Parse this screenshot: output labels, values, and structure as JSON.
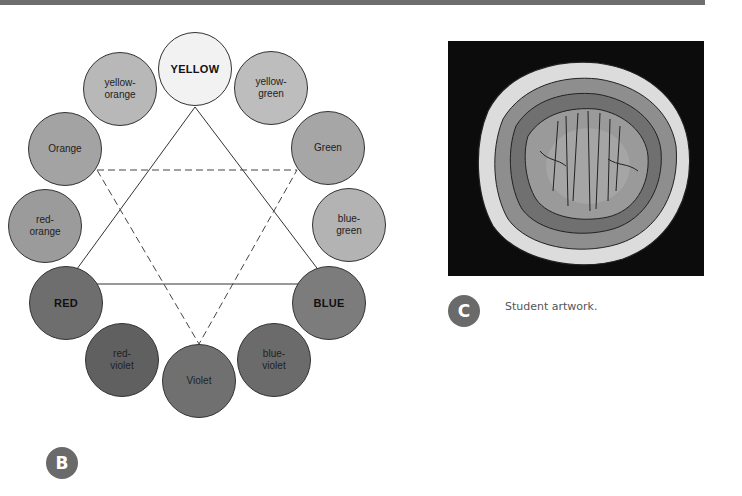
{
  "figure_b": {
    "badge": "B",
    "swatches": [
      {
        "id": "yellow",
        "label": "YELLOW",
        "primary": true,
        "cx": 195,
        "cy": 69,
        "fill": "#f2f2f2"
      },
      {
        "id": "yellow-green",
        "label": "yellow-\ngreen",
        "primary": false,
        "cx": 271,
        "cy": 88,
        "fill": "#bdbdbd"
      },
      {
        "id": "green",
        "label": "Green",
        "primary": false,
        "cx": 328,
        "cy": 148,
        "fill": "#a6a6a6"
      },
      {
        "id": "blue-green",
        "label": "blue-\ngreen",
        "primary": false,
        "cx": 349,
        "cy": 225,
        "fill": "#b3b3b3"
      },
      {
        "id": "blue",
        "label": "BLUE",
        "primary": true,
        "cx": 329,
        "cy": 303,
        "fill": "#7c7c7c"
      },
      {
        "id": "blue-violet",
        "label": "blue-\nviolet",
        "primary": false,
        "cx": 274,
        "cy": 360,
        "fill": "#6b6b6b"
      },
      {
        "id": "violet",
        "label": "Violet",
        "primary": false,
        "cx": 199,
        "cy": 381,
        "fill": "#707070"
      },
      {
        "id": "red-violet",
        "label": "red-\nviolet",
        "primary": false,
        "cx": 122,
        "cy": 360,
        "fill": "#606060"
      },
      {
        "id": "red",
        "label": "RED",
        "primary": true,
        "cx": 66,
        "cy": 303,
        "fill": "#6e6e6e"
      },
      {
        "id": "red-orange",
        "label": "red-\norange",
        "primary": false,
        "cx": 45,
        "cy": 226,
        "fill": "#9b9b9b"
      },
      {
        "id": "orange",
        "label": "Orange",
        "primary": false,
        "cx": 65,
        "cy": 149,
        "fill": "#a3a3a3"
      },
      {
        "id": "yellow-orange",
        "label": "yellow-\norange",
        "primary": false,
        "cx": 120,
        "cy": 89,
        "fill": "#b8b8b8"
      }
    ],
    "primary_triangle": [
      [
        195,
        107
      ],
      [
        329,
        284
      ],
      [
        66,
        284
      ]
    ],
    "secondary_triangle": [
      [
        97,
        170
      ],
      [
        297,
        170
      ],
      [
        199,
        344
      ]
    ]
  },
  "figure_c": {
    "badge": "C",
    "caption": "Student artwork."
  }
}
